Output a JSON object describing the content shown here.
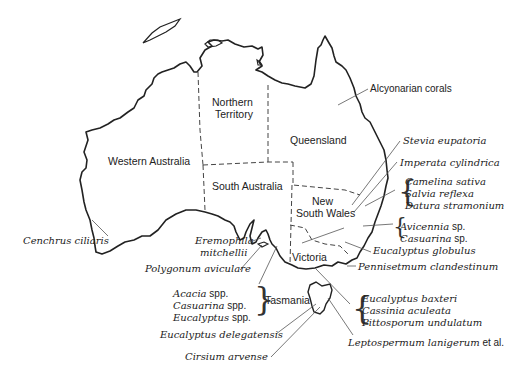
{
  "map": {
    "title": "",
    "regions": [
      {
        "id": "wa",
        "label": "Western Australia"
      },
      {
        "id": "nt",
        "label_line1": "Northern",
        "label_line2": "Territory"
      },
      {
        "id": "qld",
        "label": "Queensland"
      },
      {
        "id": "sa",
        "label": "South Australia"
      },
      {
        "id": "nsw",
        "label_line1": "New",
        "label_line2": "South Wales"
      },
      {
        "id": "vic",
        "label": "Victoria"
      },
      {
        "id": "tas",
        "label": "Tasmania"
      }
    ],
    "annotations": {
      "alcyonarian": "Alcyonarian corals",
      "stevia": "Stevia eupatoria",
      "imperata": "Imperata cylindrica",
      "group_nsw": [
        "Camelina sativa",
        "Salvia reflexa",
        "Datura stramonium"
      ],
      "avicennia": {
        "genus": "Avicennia",
        "suffix": " sp."
      },
      "casuarina_sp": {
        "genus": "Casuarina",
        "suffix": " sp."
      },
      "eucalyptus_globulus": "Eucalyptus globulus",
      "pennisetum": "Pennisetmum clandestinum",
      "cenchrus": "Cenchrus ciliaris",
      "eremophila_1": "Eremophila",
      "eremophila_2": "mitchellii",
      "polygonum": "Polygonum aviculare",
      "group_tas": [
        {
          "genus": "Acacia",
          "suffix": " spp."
        },
        {
          "genus": "Casuarina",
          "suffix": " spp."
        },
        {
          "genus": "Eucalyptus",
          "suffix": " spp."
        }
      ],
      "group_vic": [
        "Eucalyptus baxteri",
        "Cassinia aculeata",
        "Pittosporum undulatum"
      ],
      "delegatensis": "Eucalyptus delegatensis",
      "cirsium": "Cirsium arvense",
      "leptospermum": {
        "genus": "Leptospermum lanigerum",
        "suffix": " et al."
      }
    },
    "colors": {
      "coast": "#222222",
      "border": "#444444",
      "leader": "#555555",
      "text": "#222222"
    }
  }
}
